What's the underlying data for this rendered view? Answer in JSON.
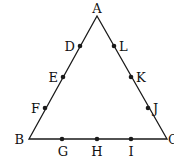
{
  "diagram": {
    "type": "triangle-with-points",
    "line_color": "#1a1a1a",
    "vertices": [
      {
        "id": "A",
        "label": "A",
        "x": 97,
        "y": 16,
        "lx": 97,
        "ly": 13,
        "anchor": "middle"
      },
      {
        "id": "B",
        "label": "B",
        "x": 29,
        "y": 139,
        "lx": 24,
        "ly": 144,
        "anchor": "end"
      },
      {
        "id": "C",
        "label": "C",
        "x": 167,
        "y": 139,
        "lx": 168,
        "ly": 144,
        "anchor": "start"
      }
    ],
    "points": [
      {
        "id": "D",
        "label": "D",
        "x": 80,
        "y": 46,
        "lx": 75,
        "ly": 51,
        "anchor": "end"
      },
      {
        "id": "E",
        "label": "E",
        "x": 63,
        "y": 77,
        "lx": 58,
        "ly": 82,
        "anchor": "end"
      },
      {
        "id": "F",
        "label": "F",
        "x": 45,
        "y": 108,
        "lx": 40,
        "ly": 113,
        "anchor": "end"
      },
      {
        "id": "G",
        "label": "G",
        "x": 62,
        "y": 139,
        "lx": 63,
        "ly": 156,
        "anchor": "middle"
      },
      {
        "id": "H",
        "label": "H",
        "x": 97,
        "y": 139,
        "lx": 97,
        "ly": 156,
        "anchor": "middle"
      },
      {
        "id": "I",
        "label": "I",
        "x": 131,
        "y": 139,
        "lx": 131,
        "ly": 156,
        "anchor": "middle"
      },
      {
        "id": "J",
        "label": "J",
        "x": 148,
        "y": 108,
        "lx": 153,
        "ly": 113,
        "anchor": "start"
      },
      {
        "id": "K",
        "label": "K",
        "x": 131,
        "y": 77,
        "lx": 136,
        "ly": 82,
        "anchor": "start"
      },
      {
        "id": "L",
        "label": "L",
        "x": 114,
        "y": 46,
        "lx": 119,
        "ly": 51,
        "anchor": "start"
      }
    ]
  }
}
